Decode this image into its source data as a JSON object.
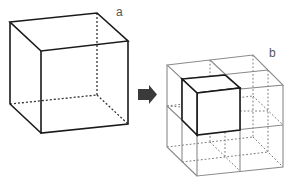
{
  "figure": {
    "panels": [
      {
        "id": "a",
        "label": "a",
        "description": "single cube (wireframe, hidden edges dotted)"
      },
      {
        "id": "b",
        "label": "b",
        "description": "cube divided into 2x2x2 sub-cubes; front-top-left sub-cube highlighted with bold edges"
      }
    ],
    "arrow": {
      "direction": "right",
      "color": "#3a3a3a"
    },
    "colors": {
      "bold_edge": "#1a1a1a",
      "thin_edge": "#8a8a8a",
      "hidden_edge": "#555555",
      "hidden_edge_light": "#9a9a9a",
      "background": "#ffffff",
      "label": "#555555"
    }
  }
}
